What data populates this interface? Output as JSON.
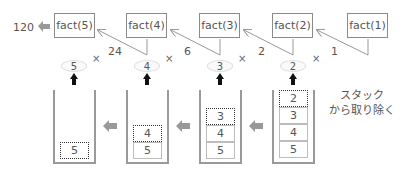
{
  "result": {
    "value": "120"
  },
  "fact_boxes": [
    {
      "label": "fact(5)"
    },
    {
      "label": "fact(4)"
    },
    {
      "label": "fact(3)"
    },
    {
      "label": "fact(2)"
    },
    {
      "label": "fact(1)"
    }
  ],
  "return_values": [
    "24",
    "6",
    "2",
    "1"
  ],
  "multiply_symbol": "×",
  "popped_values": [
    "5",
    "4",
    "3",
    "2"
  ],
  "stacks": [
    {
      "cells": [
        "5"
      ],
      "popped_index": 0
    },
    {
      "cells": [
        "4",
        "5"
      ],
      "popped_index": 0
    },
    {
      "cells": [
        "3",
        "4",
        "5"
      ],
      "popped_index": 0
    },
    {
      "cells": [
        "2",
        "3",
        "4",
        "5"
      ],
      "popped_index": 0
    }
  ],
  "caption": {
    "line1": "スタック",
    "line2": "から取り除く"
  },
  "colors": {
    "box_border": "#8a8a8a",
    "arrow_gray": "#999999",
    "arrow_dark": "#111111",
    "line_gray": "#9a9a9a"
  }
}
